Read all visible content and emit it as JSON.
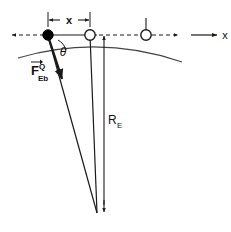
{
  "figure": {
    "labels": {
      "horizontal_distance": "x",
      "axis_label": "x",
      "angle": "θ",
      "force_symbol": "F",
      "force_superscript": "Q",
      "force_subscript": "Eb",
      "radius_symbol": "R",
      "radius_subscript": "E"
    },
    "colors": {
      "line": "#1a1a1a",
      "arc": "#444444",
      "filled_marker": "#000000",
      "open_marker_fill": "#ffffff",
      "background": "#ffffff"
    },
    "geometry": {
      "filled_ball_x": 48,
      "filled_ball_y": 35,
      "open_ball_x": 90,
      "open_ball_y": 35,
      "second_open_ball_x": 146,
      "second_open_ball_y": 35,
      "earth_center_x": 97,
      "earth_center_y": 213,
      "dimension_line_y": 20,
      "radius_label_x": 110,
      "radius_label_y": 120
    }
  }
}
